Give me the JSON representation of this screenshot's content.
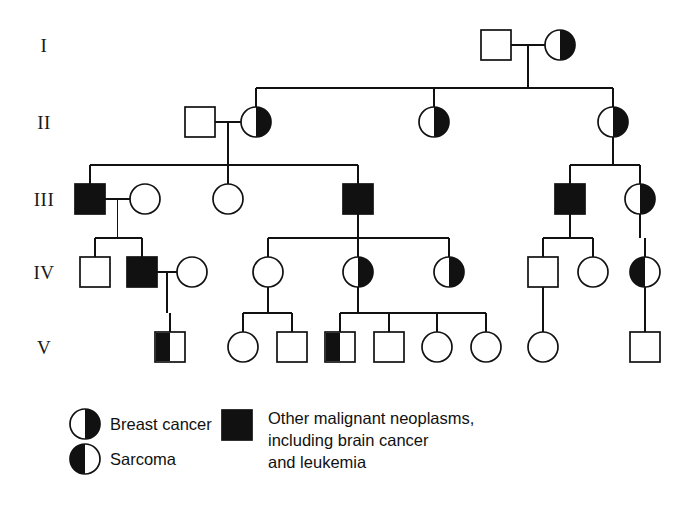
{
  "figure": {
    "colors": {
      "ink": "#111111",
      "paper": "#ffffff"
    },
    "generation_labels": [
      "I",
      "II",
      "III",
      "IV",
      "V"
    ]
  },
  "legend": {
    "items": [
      {
        "key": "breast",
        "shape": "circle",
        "fill": "half-right",
        "label": "Breast cancer"
      },
      {
        "key": "sarcoma",
        "shape": "circle",
        "fill": "half-left",
        "label": "Sarcoma"
      },
      {
        "key": "other",
        "shape": "square",
        "fill": "full",
        "label_line1": "Other malignant neoplasms,",
        "label_line2": "including brain cancer",
        "label_line3": "and leukemia"
      }
    ]
  },
  "chart_data": {
    "type": "pedigree",
    "generations": [
      "I",
      "II",
      "III",
      "IV",
      "V"
    ],
    "fill_legend": {
      "half-right": "Breast cancer",
      "half-left": "Sarcoma",
      "full": "Other malignant neoplasms, including brain cancer and leukemia",
      "open": "Unaffected"
    },
    "individuals": [
      {
        "id": "I-1",
        "generation": "I",
        "sex": "male",
        "fill": "open",
        "x": 496,
        "y": 45
      },
      {
        "id": "I-2",
        "generation": "I",
        "sex": "female",
        "fill": "half-right",
        "x": 560,
        "y": 45
      },
      {
        "id": "II-1",
        "generation": "II",
        "sex": "male",
        "fill": "open",
        "x": 200,
        "y": 122
      },
      {
        "id": "II-2",
        "generation": "II",
        "sex": "female",
        "fill": "half-right",
        "x": 256,
        "y": 122
      },
      {
        "id": "II-3",
        "generation": "II",
        "sex": "female",
        "fill": "half-right",
        "x": 434,
        "y": 122
      },
      {
        "id": "II-4",
        "generation": "II",
        "sex": "female",
        "fill": "half-right",
        "x": 613,
        "y": 122
      },
      {
        "id": "III-1",
        "generation": "III",
        "sex": "male",
        "fill": "full",
        "x": 90,
        "y": 199
      },
      {
        "id": "III-2",
        "generation": "III",
        "sex": "female",
        "fill": "open",
        "x": 145,
        "y": 199
      },
      {
        "id": "III-3",
        "generation": "III",
        "sex": "female",
        "fill": "open",
        "x": 228,
        "y": 199
      },
      {
        "id": "III-4",
        "generation": "III",
        "sex": "male",
        "fill": "full",
        "x": 358,
        "y": 199
      },
      {
        "id": "III-5",
        "generation": "III",
        "sex": "male",
        "fill": "full",
        "x": 570,
        "y": 199
      },
      {
        "id": "III-6",
        "generation": "III",
        "sex": "female",
        "fill": "half-right",
        "x": 640,
        "y": 199
      },
      {
        "id": "IV-1",
        "generation": "IV",
        "sex": "male",
        "fill": "open",
        "x": 95,
        "y": 272
      },
      {
        "id": "IV-2",
        "generation": "IV",
        "sex": "male",
        "fill": "full",
        "x": 142,
        "y": 272
      },
      {
        "id": "IV-3",
        "generation": "IV",
        "sex": "female",
        "fill": "open",
        "x": 192,
        "y": 272
      },
      {
        "id": "IV-4",
        "generation": "IV",
        "sex": "female",
        "fill": "open",
        "x": 268,
        "y": 272
      },
      {
        "id": "IV-5",
        "generation": "IV",
        "sex": "female",
        "fill": "half-right",
        "x": 358,
        "y": 272
      },
      {
        "id": "IV-6",
        "generation": "IV",
        "sex": "female",
        "fill": "half-right",
        "x": 449,
        "y": 272
      },
      {
        "id": "IV-7",
        "generation": "IV",
        "sex": "male",
        "fill": "open",
        "x": 543,
        "y": 272
      },
      {
        "id": "IV-8",
        "generation": "IV",
        "sex": "female",
        "fill": "open",
        "x": 593,
        "y": 272
      },
      {
        "id": "IV-9",
        "generation": "IV",
        "sex": "female",
        "fill": "half-left",
        "x": 645,
        "y": 272
      },
      {
        "id": "V-1",
        "generation": "V",
        "sex": "male",
        "fill": "half-left",
        "x": 170,
        "y": 347
      },
      {
        "id": "V-2",
        "generation": "V",
        "sex": "female",
        "fill": "open",
        "x": 243,
        "y": 347
      },
      {
        "id": "V-3",
        "generation": "V",
        "sex": "male",
        "fill": "open",
        "x": 292,
        "y": 347
      },
      {
        "id": "V-4",
        "generation": "V",
        "sex": "male",
        "fill": "half-left",
        "x": 340,
        "y": 347
      },
      {
        "id": "V-5",
        "generation": "V",
        "sex": "male",
        "fill": "open",
        "x": 389,
        "y": 347
      },
      {
        "id": "V-6",
        "generation": "V",
        "sex": "female",
        "fill": "open",
        "x": 437,
        "y": 347
      },
      {
        "id": "V-7",
        "generation": "V",
        "sex": "female",
        "fill": "open",
        "x": 486,
        "y": 347
      },
      {
        "id": "V-8",
        "generation": "V",
        "sex": "female",
        "fill": "open",
        "x": 543,
        "y": 347
      },
      {
        "id": "V-9",
        "generation": "V",
        "sex": "male",
        "fill": "open",
        "x": 645,
        "y": 347
      }
    ],
    "matings": [
      {
        "id": "m1",
        "partners": [
          "I-1",
          "I-2"
        ],
        "children": [
          "II-2",
          "II-3",
          "II-4"
        ]
      },
      {
        "id": "m2",
        "partners": [
          "II-1",
          "II-2"
        ],
        "children": [
          "III-1",
          "III-3",
          "III-4"
        ]
      },
      {
        "id": "m3",
        "partners": [
          "II-4"
        ],
        "children": [
          "III-5",
          "III-6"
        ]
      },
      {
        "id": "m4",
        "partners": [
          "III-1",
          "III-2"
        ],
        "children": [
          "IV-1",
          "IV-2"
        ]
      },
      {
        "id": "m5",
        "partners": [
          "III-4"
        ],
        "children": [
          "IV-4",
          "IV-5",
          "IV-6"
        ]
      },
      {
        "id": "m6",
        "partners": [
          "III-5"
        ],
        "children": [
          "IV-7",
          "IV-8"
        ]
      },
      {
        "id": "m7",
        "partners": [
          "III-6"
        ],
        "children": [
          "IV-9"
        ]
      },
      {
        "id": "m8",
        "partners": [
          "IV-2",
          "IV-3"
        ],
        "children": [
          "V-1"
        ]
      },
      {
        "id": "m9",
        "partners": [
          "IV-4"
        ],
        "children": [
          "V-2",
          "V-3"
        ]
      },
      {
        "id": "m10",
        "partners": [
          "IV-5"
        ],
        "children": [
          "V-4",
          "V-5",
          "V-6",
          "V-7"
        ]
      },
      {
        "id": "m11",
        "partners": [
          "IV-7"
        ],
        "children": [
          "V-8"
        ]
      },
      {
        "id": "m12",
        "partners": [
          "IV-9"
        ],
        "children": [
          "V-9"
        ]
      }
    ],
    "counts": {
      "total_individuals": 29,
      "breast_cancer": 7,
      "sarcoma": 3,
      "other_neoplasms": 5,
      "unaffected": 14
    }
  },
  "geometry": {
    "square_size": 30,
    "circle_radius": 15,
    "gen_label_x": 44,
    "gen_rows_y": [
      45,
      122,
      199,
      272,
      347
    ],
    "legend": {
      "breast_icon": {
        "cx": 85,
        "cy": 424
      },
      "sarcoma_icon": {
        "cx": 85,
        "cy": 459
      },
      "other_icon": {
        "x": 222,
        "y": 410,
        "w": 30,
        "h": 30
      },
      "breast_text": {
        "x": 110,
        "y": 430
      },
      "sarcoma_text": {
        "x": 110,
        "y": 465
      },
      "other_text": {
        "x": 268,
        "y": 424,
        "line_height": 22
      }
    }
  }
}
